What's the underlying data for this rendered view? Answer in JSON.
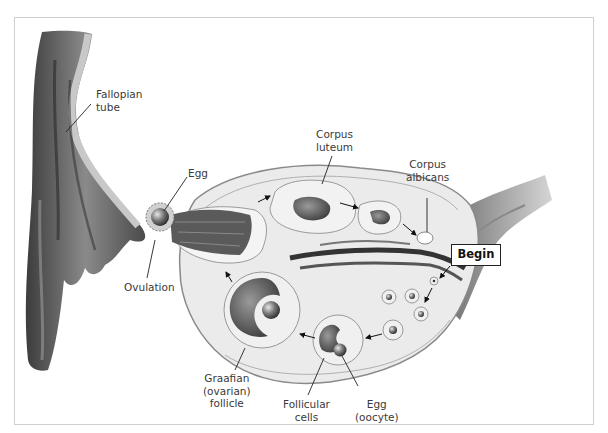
{
  "diagram": {
    "labels": {
      "fallopian_tube": "Fallopian\ntube",
      "egg_top": "Egg",
      "ovulation": "Ovulation",
      "corpus_luteum": "Corpus\nluteum",
      "corpus_albicans": "Corpus\nalbicans",
      "begin": "Begin",
      "graafian_follicle": "Graafian\n(ovarian)\nfollicle",
      "follicular_cells": "Follicular\ncells",
      "egg_oocyte": "Egg\n(oocyte)"
    },
    "colors": {
      "ovary_fill": "#ebebeb",
      "tissue_dark": "#555555",
      "line": "#333333",
      "frame": "#cfcfcf"
    }
  }
}
